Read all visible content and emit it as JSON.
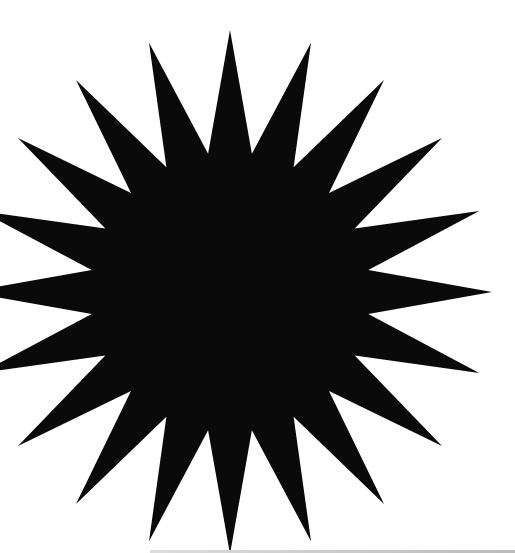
{
  "image": {
    "description": "Black 20-point starburst on white background",
    "shape": "starburst",
    "points": 20,
    "fill_color": "#0a0a0a",
    "background_color": "#ffffff",
    "center": [
      230,
      292
    ],
    "outer_radius": 262,
    "inner_radius": 140
  }
}
